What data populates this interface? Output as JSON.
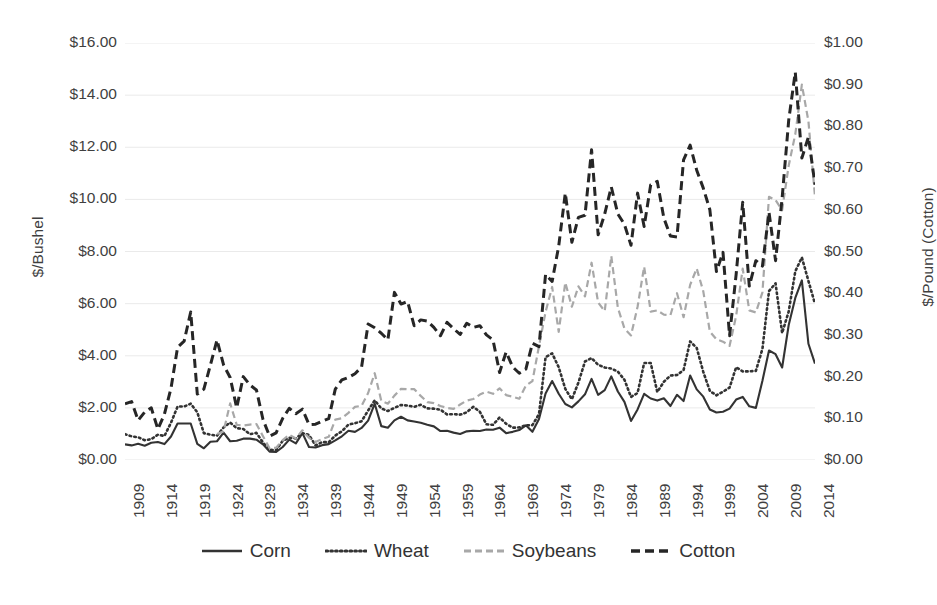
{
  "chart_data": {
    "type": "line",
    "title": "",
    "subtitle": "",
    "xlabel": "",
    "ylabel": "$/Bushel",
    "y2label": "$/Pound (Cotton)",
    "grid": true,
    "legend_position": "bottom",
    "xlim": [
      1909,
      2014
    ],
    "ylim": [
      0,
      16
    ],
    "y2lim": [
      0,
      1.0
    ],
    "y_tick_labels": [
      "$16.00",
      "$14.00",
      "$12.00",
      "$10.00",
      "$8.00",
      "$6.00",
      "$4.00",
      "$2.00",
      "$0.00"
    ],
    "y_tick_values": [
      16,
      14,
      12,
      10,
      8,
      6,
      4,
      2,
      0
    ],
    "y2_tick_labels": [
      "$1.00",
      "$0.90",
      "$0.80",
      "$0.70",
      "$0.60",
      "$0.50",
      "$0.40",
      "$0.30",
      "$0.20",
      "$0.10",
      "$0.00"
    ],
    "y2_tick_values": [
      1.0,
      0.9,
      0.8,
      0.7,
      0.6,
      0.5,
      0.4,
      0.3,
      0.2,
      0.1,
      0.0
    ],
    "x_tick_labels": [
      "1909",
      "1914",
      "1919",
      "1924",
      "1929",
      "1934",
      "1939",
      "1944",
      "1949",
      "1954",
      "1959",
      "1964",
      "1969",
      "1974",
      "1979",
      "1984",
      "1989",
      "1994",
      "1999",
      "2004",
      "2009",
      "2014"
    ],
    "x": [
      1909,
      1910,
      1911,
      1912,
      1913,
      1914,
      1915,
      1916,
      1917,
      1918,
      1919,
      1920,
      1921,
      1922,
      1923,
      1924,
      1925,
      1926,
      1927,
      1928,
      1929,
      1930,
      1931,
      1932,
      1933,
      1934,
      1935,
      1936,
      1937,
      1938,
      1939,
      1940,
      1941,
      1942,
      1943,
      1944,
      1945,
      1946,
      1947,
      1948,
      1949,
      1950,
      1951,
      1952,
      1953,
      1954,
      1955,
      1956,
      1957,
      1958,
      1959,
      1960,
      1961,
      1962,
      1963,
      1964,
      1965,
      1966,
      1967,
      1968,
      1969,
      1970,
      1971,
      1972,
      1973,
      1974,
      1975,
      1976,
      1977,
      1978,
      1979,
      1980,
      1981,
      1982,
      1983,
      1984,
      1985,
      1986,
      1987,
      1988,
      1989,
      1990,
      1991,
      1992,
      1993,
      1994,
      1995,
      1996,
      1997,
      1998,
      1999,
      2000,
      2001,
      2002,
      2003,
      2004,
      2005,
      2006,
      2007,
      2008,
      2009,
      2010,
      2011,
      2012,
      2013,
      2014
    ],
    "series": [
      {
        "name": "Corn",
        "axis": "left",
        "unit": "$/bushel",
        "style": "solid",
        "color": "#333333",
        "values": [
          0.6,
          0.56,
          0.62,
          0.55,
          0.66,
          0.69,
          0.61,
          0.9,
          1.4,
          1.4,
          1.4,
          0.62,
          0.45,
          0.7,
          0.72,
          1.05,
          0.72,
          0.74,
          0.82,
          0.82,
          0.78,
          0.6,
          0.32,
          0.31,
          0.5,
          0.78,
          0.64,
          1.03,
          0.5,
          0.48,
          0.57,
          0.61,
          0.75,
          0.91,
          1.12,
          1.08,
          1.23,
          1.51,
          2.16,
          1.3,
          1.24,
          1.52,
          1.66,
          1.52,
          1.48,
          1.43,
          1.35,
          1.29,
          1.11,
          1.12,
          1.05,
          1.0,
          1.1,
          1.12,
          1.11,
          1.17,
          1.16,
          1.24,
          1.03,
          1.08,
          1.15,
          1.33,
          1.08,
          1.57,
          2.55,
          3.03,
          2.54,
          2.15,
          2.02,
          2.25,
          2.52,
          3.11,
          2.5,
          2.68,
          3.21,
          2.63,
          2.23,
          1.5,
          1.94,
          2.54,
          2.36,
          2.28,
          2.37,
          2.07,
          2.5,
          2.26,
          3.24,
          2.71,
          2.43,
          1.94,
          1.82,
          1.85,
          1.97,
          2.32,
          2.42,
          2.06,
          2.0,
          3.04,
          4.2,
          4.06,
          3.55,
          5.18,
          6.22,
          6.89,
          4.46,
          3.7
        ]
      },
      {
        "name": "Wheat",
        "axis": "left",
        "unit": "$/bushel",
        "style": "dotted",
        "color": "#333333",
        "values": [
          0.99,
          0.91,
          0.87,
          0.76,
          0.8,
          0.97,
          0.92,
          1.43,
          2.05,
          2.05,
          2.16,
          1.83,
          1.03,
          0.97,
          0.93,
          1.25,
          1.44,
          1.22,
          1.19,
          0.99,
          1.04,
          0.67,
          0.39,
          0.38,
          0.74,
          0.85,
          0.83,
          1.03,
          0.96,
          0.56,
          0.69,
          0.68,
          0.94,
          1.1,
          1.36,
          1.41,
          1.49,
          1.9,
          2.29,
          1.98,
          1.88,
          2.0,
          2.11,
          2.09,
          2.04,
          2.12,
          1.98,
          1.97,
          1.93,
          1.75,
          1.76,
          1.74,
          1.83,
          2.04,
          1.85,
          1.37,
          1.35,
          1.63,
          1.39,
          1.24,
          1.25,
          1.33,
          1.34,
          1.76,
          3.95,
          4.09,
          3.56,
          2.73,
          2.33,
          2.97,
          3.78,
          3.91,
          3.65,
          3.55,
          3.51,
          3.39,
          3.08,
          2.42,
          2.57,
          3.72,
          3.72,
          2.61,
          3.0,
          3.24,
          3.26,
          3.45,
          4.55,
          4.3,
          3.38,
          2.65,
          2.48,
          2.62,
          2.78,
          3.56,
          3.4,
          3.4,
          3.42,
          4.26,
          6.48,
          6.78,
          4.87,
          5.7,
          7.24,
          7.77,
          6.87,
          5.99
        ]
      },
      {
        "name": "Soybeans",
        "axis": "left",
        "unit": "$/bushel",
        "style": "dashed",
        "color": "#a8a8a8",
        "values": [
          null,
          null,
          null,
          null,
          null,
          null,
          null,
          null,
          null,
          null,
          null,
          null,
          null,
          null,
          1.0,
          1.1,
          2.17,
          1.35,
          1.32,
          1.36,
          1.38,
          0.91,
          0.45,
          0.47,
          0.76,
          0.97,
          0.83,
          1.14,
          0.85,
          0.69,
          0.81,
          0.89,
          1.55,
          1.6,
          1.81,
          2.04,
          2.08,
          2.57,
          3.33,
          2.27,
          2.16,
          2.47,
          2.73,
          2.72,
          2.72,
          2.46,
          2.22,
          2.18,
          2.07,
          2.0,
          1.96,
          2.13,
          2.28,
          2.34,
          2.51,
          2.62,
          2.54,
          2.75,
          2.49,
          2.43,
          2.35,
          2.85,
          3.03,
          4.37,
          5.68,
          6.64,
          4.92,
          6.81,
          5.88,
          6.66,
          6.28,
          7.57,
          6.04,
          5.71,
          7.83,
          5.84,
          5.05,
          4.78,
          5.88,
          7.42,
          5.69,
          5.74,
          5.58,
          5.56,
          6.4,
          5.48,
          6.72,
          7.35,
          6.47,
          4.93,
          4.63,
          4.54,
          4.38,
          5.53,
          7.34,
          5.74,
          5.66,
          6.43,
          10.1,
          9.97,
          9.59,
          11.3,
          12.5,
          14.4,
          13.0,
          10.1
        ]
      },
      {
        "name": "Cotton",
        "axis": "right",
        "unit": "$/pound",
        "style": "longdash",
        "color": "#262626",
        "values": [
          0.135,
          0.14,
          0.095,
          0.115,
          0.125,
          0.074,
          0.11,
          0.172,
          0.27,
          0.285,
          0.355,
          0.158,
          0.17,
          0.228,
          0.288,
          0.228,
          0.198,
          0.125,
          0.2,
          0.18,
          0.168,
          0.097,
          0.057,
          0.065,
          0.1,
          0.124,
          0.111,
          0.122,
          0.085,
          0.086,
          0.093,
          0.099,
          0.17,
          0.192,
          0.198,
          0.207,
          0.223,
          0.326,
          0.317,
          0.304,
          0.288,
          0.402,
          0.374,
          0.38,
          0.322,
          0.336,
          0.333,
          0.318,
          0.298,
          0.33,
          0.315,
          0.301,
          0.328,
          0.318,
          0.322,
          0.3,
          0.288,
          0.21,
          0.259,
          0.223,
          0.208,
          0.218,
          0.28,
          0.272,
          0.445,
          0.428,
          0.513,
          0.64,
          0.522,
          0.582,
          0.587,
          0.744,
          0.54,
          0.59,
          0.655,
          0.59,
          0.565,
          0.515,
          0.64,
          0.56,
          0.66,
          0.668,
          0.58,
          0.537,
          0.535,
          0.72,
          0.755,
          0.695,
          0.652,
          0.6,
          0.452,
          0.498,
          0.298,
          0.445,
          0.618,
          0.417,
          0.478,
          0.465,
          0.594,
          0.478,
          0.628,
          0.815,
          0.93,
          0.724,
          0.775,
          0.66
        ]
      }
    ]
  },
  "legend": {
    "items": [
      {
        "label": "Corn",
        "style": "solid",
        "color": "#333333"
      },
      {
        "label": "Wheat",
        "style": "dotted",
        "color": "#333333"
      },
      {
        "label": "Soybeans",
        "style": "dashed",
        "color": "#a8a8a8"
      },
      {
        "label": "Cotton",
        "style": "longdash",
        "color": "#262626"
      }
    ]
  }
}
